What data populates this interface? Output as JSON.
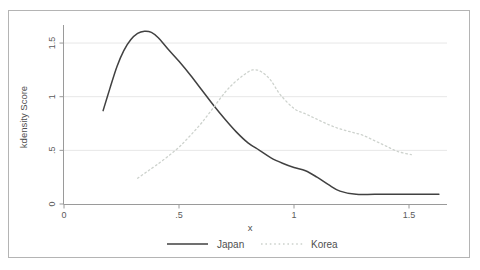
{
  "figure": {
    "background": "#ffffff",
    "border_color": "#b4b4b4"
  },
  "colors": {
    "axis": "#9a9a9a",
    "grid": "#e7e7e7",
    "tick_text": "#5a5a5a",
    "title_text": "#4f4f4f"
  },
  "chart_data": {
    "type": "line",
    "title": "",
    "xlabel": "x",
    "ylabel": "kdensity Score",
    "xlim": [
      0,
      1.66
    ],
    "ylim": [
      0,
      1.66
    ],
    "grid": "horizontal-y-gridlines",
    "legend_position": "bottom-center",
    "x_ticks": [
      {
        "value": 0,
        "label": "0"
      },
      {
        "value": 0.5,
        "label": ".5"
      },
      {
        "value": 1,
        "label": "1"
      },
      {
        "value": 1.5,
        "label": "1.5"
      }
    ],
    "y_ticks": [
      {
        "value": 0,
        "label": "0"
      },
      {
        "value": 0.5,
        "label": ".5"
      },
      {
        "value": 1,
        "label": "1"
      },
      {
        "value": 1.5,
        "label": "1.5"
      }
    ],
    "series": [
      {
        "name": "Japan",
        "line_style": "solid",
        "color": "#414141",
        "peak": {
          "x": 0.35,
          "y": 1.61
        },
        "points": [
          [
            0.17,
            0.87
          ],
          [
            0.2,
            1.08
          ],
          [
            0.23,
            1.28
          ],
          [
            0.26,
            1.43
          ],
          [
            0.29,
            1.53
          ],
          [
            0.32,
            1.59
          ],
          [
            0.35,
            1.61
          ],
          [
            0.38,
            1.6
          ],
          [
            0.41,
            1.55
          ],
          [
            0.45,
            1.45
          ],
          [
            0.5,
            1.33
          ],
          [
            0.55,
            1.2
          ],
          [
            0.6,
            1.06
          ],
          [
            0.65,
            0.92
          ],
          [
            0.7,
            0.79
          ],
          [
            0.75,
            0.67
          ],
          [
            0.8,
            0.57
          ],
          [
            0.85,
            0.5
          ],
          [
            0.9,
            0.43
          ],
          [
            0.95,
            0.38
          ],
          [
            1.0,
            0.34
          ],
          [
            1.05,
            0.31
          ],
          [
            1.1,
            0.25
          ],
          [
            1.15,
            0.18
          ],
          [
            1.2,
            0.12
          ],
          [
            1.27,
            0.09
          ],
          [
            1.35,
            0.09
          ],
          [
            1.45,
            0.09
          ],
          [
            1.55,
            0.09
          ],
          [
            1.63,
            0.09
          ]
        ]
      },
      {
        "name": "Korea",
        "line_style": "dotted",
        "color": "#cdd2cd",
        "peak": {
          "x": 0.82,
          "y": 1.25
        },
        "points": [
          [
            0.32,
            0.24
          ],
          [
            0.36,
            0.3
          ],
          [
            0.4,
            0.36
          ],
          [
            0.45,
            0.44
          ],
          [
            0.5,
            0.53
          ],
          [
            0.55,
            0.64
          ],
          [
            0.6,
            0.76
          ],
          [
            0.65,
            0.9
          ],
          [
            0.7,
            1.04
          ],
          [
            0.74,
            1.13
          ],
          [
            0.78,
            1.2
          ],
          [
            0.82,
            1.25
          ],
          [
            0.86,
            1.23
          ],
          [
            0.9,
            1.15
          ],
          [
            0.94,
            1.02
          ],
          [
            1.0,
            0.89
          ],
          [
            1.05,
            0.84
          ],
          [
            1.1,
            0.79
          ],
          [
            1.15,
            0.74
          ],
          [
            1.2,
            0.7
          ],
          [
            1.25,
            0.67
          ],
          [
            1.3,
            0.64
          ],
          [
            1.35,
            0.59
          ],
          [
            1.4,
            0.54
          ],
          [
            1.45,
            0.49
          ],
          [
            1.51,
            0.46
          ]
        ]
      }
    ]
  }
}
